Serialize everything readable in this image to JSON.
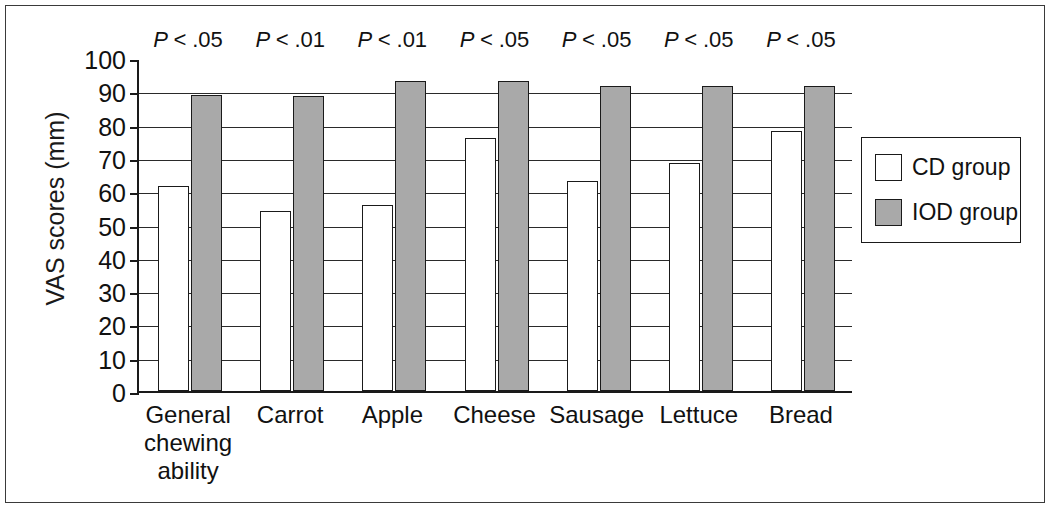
{
  "chart_data": {
    "type": "bar",
    "title": "",
    "subtitle": "",
    "xlabel": "",
    "ylabel": "VAS scores (mm)",
    "ylim": [
      0,
      100
    ],
    "ytick_step": 10,
    "yticks": [
      "100",
      "90",
      "80",
      "70",
      "60",
      "50",
      "40",
      "30",
      "20",
      "10",
      "0"
    ],
    "grid": "horizontal",
    "legend_position": "right",
    "categories": [
      "General chewing ability",
      "Carrot",
      "Apple",
      "Cheese",
      "Sausage",
      "Lettuce",
      "Bread"
    ],
    "category_lines": [
      [
        "General",
        "chewing",
        "ability"
      ],
      [
        "Carrot"
      ],
      [
        "Apple"
      ],
      [
        "Cheese"
      ],
      [
        "Sausage"
      ],
      [
        "Lettuce"
      ],
      [
        "Bread"
      ]
    ],
    "series": [
      {
        "name": "CD group",
        "color": "#ffffff",
        "values": [
          61.5,
          54,
          56,
          76,
          63,
          68.5,
          78
        ]
      },
      {
        "name": "IOD group",
        "color": "#a9a9a9",
        "values": [
          89,
          88.5,
          93,
          93,
          91.5,
          91.5,
          91.5
        ]
      }
    ],
    "annotations": [
      {
        "text": "P < .05",
        "symbol": "P <",
        "value": ".05",
        "category": "General chewing ability"
      },
      {
        "text": "P < .01",
        "symbol": "P <",
        "value": ".01",
        "category": "Carrot"
      },
      {
        "text": "P < .01",
        "symbol": "P <",
        "value": ".01",
        "category": "Apple"
      },
      {
        "text": "P < .05",
        "symbol": "P <",
        "value": ".05",
        "category": "Cheese"
      },
      {
        "text": "P < .05",
        "symbol": "P <",
        "value": ".05",
        "category": "Sausage"
      },
      {
        "text": "P < .05",
        "symbol": "P <",
        "value": ".05",
        "category": "Lettuce"
      },
      {
        "text": "P < .05",
        "symbol": "P <",
        "value": ".05",
        "category": "Bread"
      }
    ]
  },
  "legend": {
    "items": [
      {
        "label": "CD group",
        "swatch": "white"
      },
      {
        "label": "IOD group",
        "swatch": "gray"
      }
    ]
  },
  "colors": {
    "cd_group": "#ffffff",
    "iod_group": "#a9a9a9",
    "axis": "#1a1a1a",
    "gridline": "#2a2a2a",
    "frame": "#3a3a3a"
  }
}
